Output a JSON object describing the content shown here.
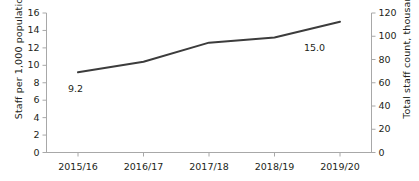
{
  "chart_data": {
    "type": "line",
    "title": "",
    "categories": [
      "2015/16",
      "2016/17",
      "2017/18",
      "2018/19",
      "2019/20"
    ],
    "series": [
      {
        "name": "Staff per 1,000 population",
        "values": [
          9.2,
          10.4,
          12.6,
          13.2,
          15.0
        ]
      }
    ],
    "point_labels": [
      {
        "index": 0,
        "text": "9.2"
      },
      {
        "index": 4,
        "text": "15.0"
      }
    ],
    "xlabel": "",
    "ylabel": "Staff per 1,000 population",
    "ylabel_secondary": "Total staff count, thousands",
    "ylim": [
      0,
      16
    ],
    "ylim_secondary": [
      0,
      120
    ],
    "yticks": [
      0,
      2,
      4,
      6,
      8,
      10,
      12,
      14,
      16
    ],
    "yticks_secondary": [
      0,
      20,
      40,
      60,
      80,
      100,
      120
    ],
    "ytick_labels": [
      "0",
      "2",
      "4",
      "6",
      "8",
      "10",
      "12",
      "14",
      "16"
    ],
    "ytick_labels_secondary": [
      "0",
      "20",
      "40",
      "60",
      "80",
      "100",
      "120"
    ],
    "grid": false,
    "legend": "none",
    "line_color": "#3c3c3c",
    "axis_color": "#a8a8a8",
    "text_color": "#231f20"
  }
}
